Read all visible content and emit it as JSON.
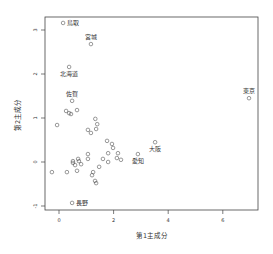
{
  "chart_data": {
    "type": "scatter",
    "title": "",
    "xlabel": "第1主成分",
    "ylabel": "第2主成分",
    "xlim": [
      -0.5,
      7.2
    ],
    "ylim": [
      -1.1,
      3.3
    ],
    "xticks": [
      0,
      2,
      4,
      6
    ],
    "yticks": [
      -1,
      0,
      1,
      2,
      3
    ],
    "grid": false,
    "legend": null,
    "labeled_points": [
      {
        "label": "鳥取",
        "x": 0.15,
        "y": 3.16,
        "label_pos": "right"
      },
      {
        "label": "宮城",
        "x": 1.17,
        "y": 2.68,
        "label_pos": "top"
      },
      {
        "label": "北海道",
        "x": 0.37,
        "y": 2.16,
        "label_pos": "bottom"
      },
      {
        "label": "佐賀",
        "x": 0.48,
        "y": 1.39,
        "label_pos": "top"
      },
      {
        "label": "東京",
        "x": 6.96,
        "y": 1.45,
        "label_pos": "top"
      },
      {
        "label": "大阪",
        "x": 3.52,
        "y": 0.45,
        "label_pos": "bottom"
      },
      {
        "label": "愛知",
        "x": 2.89,
        "y": 0.18,
        "label_pos": "bottom"
      },
      {
        "label": "長野",
        "x": 0.48,
        "y": -0.93,
        "label_pos": "right"
      }
    ],
    "points": [
      {
        "x": 0.26,
        "y": 1.16
      },
      {
        "x": 0.37,
        "y": 1.11
      },
      {
        "x": 0.44,
        "y": 1.09
      },
      {
        "x": 0.66,
        "y": 1.18
      },
      {
        "x": -0.07,
        "y": 0.84
      },
      {
        "x": 1.33,
        "y": 0.98
      },
      {
        "x": 1.4,
        "y": 0.86
      },
      {
        "x": 1.06,
        "y": 0.73
      },
      {
        "x": 1.17,
        "y": 0.66
      },
      {
        "x": 1.36,
        "y": 0.75
      },
      {
        "x": -0.26,
        "y": -0.23
      },
      {
        "x": 0.29,
        "y": -0.23
      },
      {
        "x": 0.66,
        "y": -0.2
      },
      {
        "x": 0.51,
        "y": 0.02
      },
      {
        "x": 0.51,
        "y": -0.02
      },
      {
        "x": 0.59,
        "y": -0.07
      },
      {
        "x": 0.7,
        "y": 0.07
      },
      {
        "x": 0.81,
        "y": -0.05
      },
      {
        "x": 0.73,
        "y": 0.02
      },
      {
        "x": 1.06,
        "y": 0.18
      },
      {
        "x": 1.06,
        "y": 0.07
      },
      {
        "x": 1.25,
        "y": -0.23
      },
      {
        "x": 1.21,
        "y": -0.3
      },
      {
        "x": 1.32,
        "y": -0.43
      },
      {
        "x": 1.36,
        "y": -0.48
      },
      {
        "x": 1.47,
        "y": -0.11
      },
      {
        "x": 1.61,
        "y": 0.07
      },
      {
        "x": 1.76,
        "y": 0.48
      },
      {
        "x": 1.94,
        "y": 0.41
      },
      {
        "x": 1.98,
        "y": 0.32
      },
      {
        "x": 1.8,
        "y": 0.2
      },
      {
        "x": 2.16,
        "y": 0.2
      },
      {
        "x": 1.8,
        "y": 0.0
      },
      {
        "x": 2.12,
        "y": 0.09
      },
      {
        "x": 2.27,
        "y": 0.05
      }
    ]
  },
  "plot_box": {
    "left": 45,
    "top": 17,
    "right": 258,
    "bottom": 210
  }
}
